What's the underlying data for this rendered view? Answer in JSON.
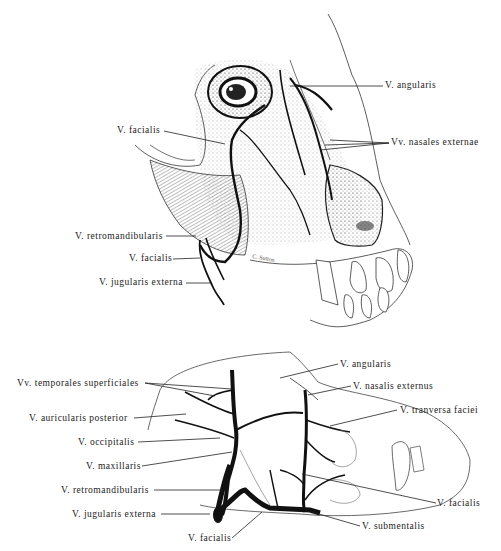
{
  "figure": {
    "top_panel": {
      "description": "Lateral view of canine head with superficial veins",
      "labels": [
        {
          "id": "top-angularis",
          "text": "V. angularis",
          "x": 385,
          "y": 83,
          "align": "left",
          "lx1": 290,
          "ly1": 86,
          "lx2": 383,
          "ly2": 86
        },
        {
          "id": "top-nasales-externae",
          "text": "Vv. nasales externae",
          "x": 391,
          "y": 140,
          "align": "left",
          "lx1": 330,
          "ly1": 143,
          "lx2": 389,
          "ly2": 143
        },
        {
          "id": "top-facialis-upper",
          "text": "V. facialis",
          "x": 120,
          "y": 126,
          "align": "right",
          "lx1": 164,
          "ly1": 131,
          "lx2": 225,
          "ly2": 144
        },
        {
          "id": "top-retromandibularis",
          "text": "V. retromandibularis",
          "x": 75,
          "y": 231,
          "align": "right",
          "lx1": 166,
          "ly1": 236,
          "lx2": 196,
          "ly2": 236
        },
        {
          "id": "top-facialis-lower",
          "text": "V. facialis",
          "x": 129,
          "y": 253,
          "align": "right",
          "lx1": 173,
          "ly1": 259,
          "lx2": 200,
          "ly2": 258
        },
        {
          "id": "top-jugularis-externa",
          "text": "V. jugularis externa",
          "x": 100,
          "y": 277,
          "align": "right",
          "lx1": 186,
          "ly1": 283,
          "lx2": 210,
          "ly2": 283
        }
      ],
      "signature": "C. Sutton"
    },
    "bottom_panel": {
      "description": "Schematic of venous drainage of the canine head",
      "labels": [
        {
          "id": "bot-temporales-superficiales",
          "text": "Vv. temporales superficiales",
          "x": 17,
          "y": 378,
          "align": "right",
          "lx1": 145,
          "ly1": 383,
          "lx2": 232,
          "ly2": 389
        },
        {
          "id": "bot-auricularis-posterior",
          "text": "V. auricularis posterior",
          "x": 28,
          "y": 413,
          "align": "right",
          "lx1": 134,
          "ly1": 418,
          "lx2": 186,
          "ly2": 414
        },
        {
          "id": "bot-occipitalis",
          "text": "V. occipitalis",
          "x": 78,
          "y": 436,
          "align": "right",
          "lx1": 138,
          "ly1": 442,
          "lx2": 220,
          "ly2": 438
        },
        {
          "id": "bot-maxillaris",
          "text": "V. maxillaris",
          "x": 85,
          "y": 461,
          "align": "right",
          "lx1": 142,
          "ly1": 466,
          "lx2": 232,
          "ly2": 452
        },
        {
          "id": "bot-retromandibularis",
          "text": "V. retromandibularis",
          "x": 60,
          "y": 485,
          "align": "right",
          "lx1": 154,
          "ly1": 490,
          "lx2": 222,
          "ly2": 490
        },
        {
          "id": "bot-jugularis-externa",
          "text": "V. jugularis externa",
          "x": 72,
          "y": 508,
          "align": "right",
          "lx1": 161,
          "ly1": 514,
          "lx2": 218,
          "ly2": 514
        },
        {
          "id": "bot-facialis-lower",
          "text": "V. facialis",
          "x": 188,
          "y": 532,
          "align": "left",
          "lx1": 232,
          "ly1": 538,
          "lx2": 262,
          "ly2": 512
        },
        {
          "id": "bot-angularis",
          "text": "V. angularis",
          "x": 340,
          "y": 359,
          "align": "left",
          "lx1": 280,
          "ly1": 378,
          "lx2": 338,
          "ly2": 364
        },
        {
          "id": "bot-nasalis-externus",
          "text": "V. nasalis externus",
          "x": 353,
          "y": 381,
          "align": "left",
          "lx1": 308,
          "ly1": 395,
          "lx2": 351,
          "ly2": 386
        },
        {
          "id": "bot-tranversa-faciei",
          "text": "V. tranversa faciei",
          "x": 399,
          "y": 405,
          "align": "left",
          "lx1": 330,
          "ly1": 426,
          "lx2": 397,
          "ly2": 410
        },
        {
          "id": "bot-facialis-right",
          "text": "V. facialis",
          "x": 438,
          "y": 498,
          "align": "left",
          "lx1": 302,
          "ly1": 474,
          "lx2": 436,
          "ly2": 503
        },
        {
          "id": "bot-submentalis",
          "text": "V. submentalis",
          "x": 362,
          "y": 521,
          "align": "left",
          "lx1": 312,
          "ly1": 512,
          "lx2": 360,
          "ly2": 526
        }
      ]
    }
  },
  "colors": {
    "ink": "#1a1a1a",
    "stipple": "#9a9a9a",
    "background": "#ffffff"
  }
}
